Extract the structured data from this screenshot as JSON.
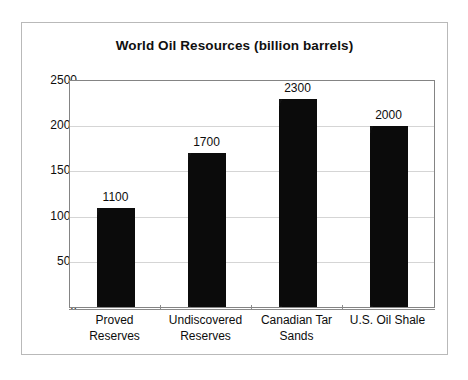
{
  "chart_data": {
    "type": "bar",
    "title": "World Oil Resources (billion barrels)",
    "xlabel": "",
    "ylabel": "",
    "categories": [
      "Proved Reserves",
      "Undiscovered Reserves",
      "Canadian Tar Sands",
      "U.S. Oil Shale"
    ],
    "category_lines": [
      [
        "Proved",
        "Reserves"
      ],
      [
        "Undiscovered",
        "Reserves"
      ],
      [
        "Canadian Tar",
        "Sands"
      ],
      [
        "U.S. Oil Shale",
        ""
      ]
    ],
    "values": [
      1100,
      1700,
      2300,
      2000
    ],
    "value_labels": [
      "1100",
      "1700",
      "2300",
      "2000"
    ],
    "ylim": [
      0,
      2500
    ],
    "yticks": [
      0,
      500,
      1000,
      1500,
      2000,
      2500
    ],
    "ytick_labels": [
      "0",
      "500",
      "1000",
      "1500",
      "2000",
      "2500"
    ],
    "grid": true,
    "legend": false,
    "legend_position": "none",
    "bar_color": "#0b0b0b",
    "gridline_color": "#d5d5d5",
    "axis_color": "#848484",
    "frame_color": "#b9b9b9",
    "text_color": "#0d0d0d",
    "background": "#ffffff"
  }
}
